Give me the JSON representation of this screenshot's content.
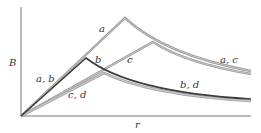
{
  "figure": {
    "axes": {
      "y_label": "B",
      "x_label": "r"
    },
    "curves": [
      {
        "id": "a",
        "label": "a",
        "color": "#8a8a8a",
        "peak": [
          125,
          18
        ]
      },
      {
        "id": "b",
        "label": "b",
        "color": "#444444",
        "peak": [
          86,
          58
        ]
      },
      {
        "id": "c",
        "label": "c",
        "color": "#8a8a8a",
        "peak": [
          153,
          42
        ]
      },
      {
        "id": "d",
        "label": "d",
        "color": "#a8a8a8",
        "peak": [
          104,
          73
        ]
      }
    ],
    "labels": {
      "a_b": "a, b",
      "a": "a",
      "b": "b",
      "c": "c",
      "c_d": "c, d",
      "b_d": "b, d",
      "a_c": "a, c"
    }
  }
}
